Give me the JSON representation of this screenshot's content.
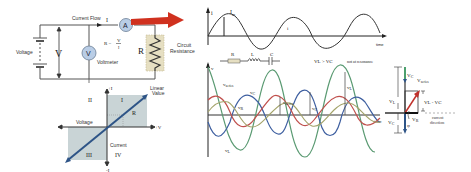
{
  "circuit": {
    "current_flow_label": "Current Flow",
    "current_symbol": "I",
    "ammeter_label": "A",
    "voltmeter_symbol": "V",
    "voltmeter_label": "Voltmeter",
    "voltage_label": "Voltage",
    "voltage_symbol": "V",
    "ohms_law": "R = V / I",
    "ohms_R": "R =",
    "ohms_num": "V",
    "ohms_den": "I",
    "resistor_symbol": "R",
    "resistance_label_1": "Circuit",
    "resistance_label_2": "Resistance",
    "colors": {
      "arrow": "#d0311f",
      "meter_fill": "#b9cde6",
      "resistor_bg": "#e6dfc2",
      "wire": "#555555"
    }
  },
  "iv_graph": {
    "plus_i": "+I",
    "minus_i": "-I",
    "plus_v": "+V",
    "minus_v": "-V",
    "quadrant_1": "I",
    "quadrant_2": "II",
    "quadrant_3": "III",
    "quadrant_4": "IV",
    "line_label_1": "Linear",
    "line_label_2": "Value",
    "slope_label": "R",
    "voltage_axis_label": "Voltage",
    "current_axis_label": "Current",
    "colors": {
      "quadrant_fill": "#c9d4d6",
      "line": "#2e5487"
    }
  },
  "current_wave": {
    "axis_label": "i",
    "peak_label": "I",
    "peak_sub": "m",
    "curve_label": "i",
    "time_label": "time"
  },
  "rlc_wave": {
    "components": [
      "R",
      "L",
      "C"
    ],
    "condition": "V",
    "condition_text": "VL > VC",
    "condition_note": "not at resonance",
    "axis_label": "v",
    "time_label": "time",
    "labels": {
      "v_series": "v",
      "v_series_sub": "series",
      "v_c": "v",
      "v_c_sub": "C",
      "v_r": "v",
      "v_r_sub": "R",
      "v_l": "v",
      "v_l_sub": "L"
    },
    "colors": {
      "v_l": "#5a9a72",
      "v_c": "#3e5fa0",
      "v_r": "#c0504d",
      "v_series": "#a3a36a"
    }
  },
  "phasor": {
    "v_c_top": "V",
    "v_c_top_sub": "C",
    "v_series": "V",
    "v_series_sub": "series",
    "v_l": "V",
    "v_l_sub": "L",
    "v_l_minus_v_c": "VL - VC",
    "v_r": "V",
    "v_r_sub": "R",
    "phi": "φ",
    "v_c_bottom": "V",
    "v_c_bottom_sub": "C",
    "current_direction_1": "current",
    "current_direction_2": "direction"
  }
}
